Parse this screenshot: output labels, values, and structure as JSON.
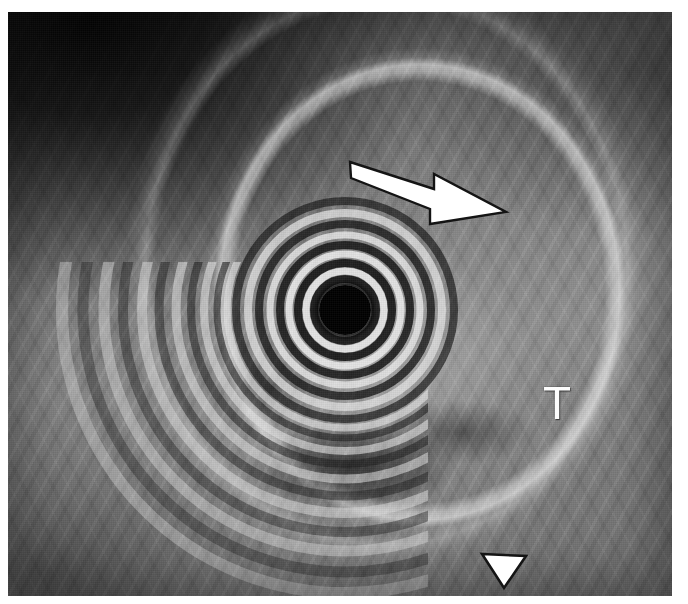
{
  "image": {
    "modality_label": "endoscopic-ultrasound",
    "colorspace": "grayscale",
    "width": 688,
    "height": 604,
    "frame": {
      "left": 8,
      "top": 12,
      "width": 664,
      "height": 584
    },
    "background_color": "#ffffff",
    "tissue_mid_gray": "#7d7d7d",
    "lumen_color": "#000000",
    "annotation_color": "#ffffff",
    "annotation_outline_color": "#111111"
  },
  "annotations": [
    {
      "name": "block-arrow",
      "glyph": "arrow-right-icon",
      "label": "",
      "description": "white block arrow pointing down-right",
      "tail": {
        "x": 342,
        "y": 152
      },
      "tip": {
        "x": 493,
        "y": 200
      },
      "color": "#ffffff",
      "outline": "#141414"
    },
    {
      "name": "tumor-label",
      "glyph": "text-label",
      "label": "T",
      "description": "capital T marking the tumor",
      "position": {
        "x": 549,
        "y": 394
      },
      "color": "#fdfdfd"
    },
    {
      "name": "arrowhead-marker",
      "glyph": "triangle-down-icon",
      "label": "",
      "description": "white solid triangle pointing down",
      "position": {
        "x": 496,
        "y": 558
      },
      "color": "#ffffff",
      "outline": "#141414"
    }
  ],
  "rings": {
    "center": {
      "x": 345,
      "y": 310
    },
    "lumen_radius": 26,
    "count": 9,
    "description": "concentric reverberation rings around the transducer lumen",
    "radii": [
      34,
      44,
      55,
      68,
      82,
      98,
      116,
      136,
      158
    ],
    "tones": [
      "#d8d8d8",
      "#1c1c1c",
      "#cfcfcf",
      "#232323",
      "#c6c6c6",
      "#2a2a2a",
      "#bdbdbd",
      "#313131",
      "#b4b4b4"
    ]
  },
  "features": [
    {
      "name": "hypoechoic-mass",
      "description": "dark hypoechoic mass below and left of T"
    },
    {
      "name": "bright-wall-band",
      "description": "bright curved wall interface arcing down the right side"
    },
    {
      "name": "dark-upper-left-field",
      "description": "very dark acoustic shadow region in the upper-left"
    },
    {
      "name": "lower-left-arcs",
      "description": "broad bright ring arcs sweeping to the lower-left edge"
    }
  ]
}
